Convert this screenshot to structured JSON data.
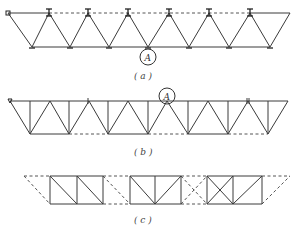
{
  "figure": {
    "panels": [
      {
        "id": "a",
        "caption": "( a )",
        "marker_label": "A",
        "description": "Inverted triangular truss with dashed top chord (bracing removed) and I-shaped clamps at upper nodes"
      },
      {
        "id": "b",
        "caption": "( b )",
        "marker_label": "A",
        "description": "Warren truss with verticals; bottom chord partly dashed"
      },
      {
        "id": "c",
        "caption": "( c )",
        "description": "Parallel-chord truss with solid panel groups and dashed connecting members"
      }
    ]
  }
}
